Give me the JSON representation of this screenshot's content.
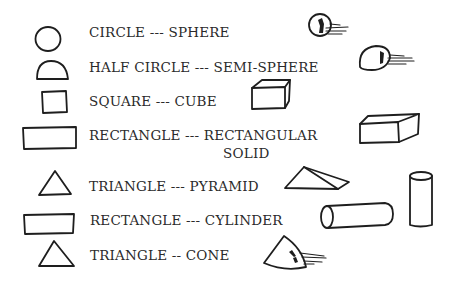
{
  "rows": [
    {
      "text": "CIRCLE --- SPHERE",
      "flat": "circle",
      "solid": "sphere"
    },
    {
      "text": "HALF CIRCLE --- SEMI-SPHERE",
      "flat": "half-circle",
      "solid": "semi-sphere"
    },
    {
      "text": "SQUARE --- CUBE",
      "flat": "square",
      "solid": "cube"
    },
    {
      "text": "RECTANGLE --- RECTANGULAR",
      "text_line2": "SOLID",
      "flat": "rectangle",
      "solid": "rectangular-solid"
    },
    {
      "text": "TRIANGLE --- PYRAMID",
      "flat": "triangle",
      "solid": "pyramid"
    },
    {
      "text": "RECTANGLE --- CYLINDER",
      "flat": "rectangle",
      "solid": "cylinder"
    },
    {
      "text": "TRIANGLE -- CONE",
      "flat": "triangle",
      "solid": "cone"
    }
  ],
  "colors": {
    "ink": "#1e1e1e",
    "background": "#ffffff"
  }
}
